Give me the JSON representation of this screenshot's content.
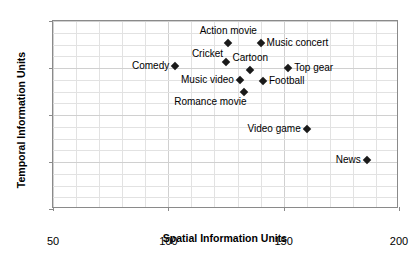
{
  "chart_data": {
    "type": "scatter",
    "title": "",
    "xlabel": "Spatial Information Units",
    "ylabel": "Temporal Information Units",
    "xlim": [
      50,
      200
    ],
    "ylim": [
      0,
      80
    ],
    "xticks": [
      "50",
      "100",
      "150",
      "200"
    ],
    "yticks": [
      "0",
      "20",
      "40",
      "60",
      "80"
    ],
    "xtick_values": [
      50,
      100,
      150,
      200
    ],
    "ytick_values": [
      0,
      20,
      40,
      60,
      80
    ],
    "grid": true,
    "grid_minor_x_step": 10,
    "grid_minor_y_step": 5,
    "legend": "none",
    "marker": "diamond",
    "marker_color": "#1a1a1a",
    "points": [
      {
        "label": "Action movie",
        "x": 126,
        "y": 70.5,
        "label_pos": "above"
      },
      {
        "label": "Music concert",
        "x": 140,
        "y": 70.5,
        "label_pos": "right"
      },
      {
        "label": "Cricket",
        "x": 125,
        "y": 62.5,
        "label_pos": "above-left"
      },
      {
        "label": "Comedy",
        "x": 103,
        "y": 61,
        "label_pos": "left"
      },
      {
        "label": "Top gear",
        "x": 152,
        "y": 60,
        "label_pos": "right"
      },
      {
        "label": "Cartoon",
        "x": 135.5,
        "y": 59,
        "label_pos": "above"
      },
      {
        "label": "Music video",
        "x": 131,
        "y": 55,
        "label_pos": "left"
      },
      {
        "label": "Football",
        "x": 141,
        "y": 54.5,
        "label_pos": "right"
      },
      {
        "label": "Romance movie",
        "x": 133,
        "y": 50,
        "label_pos": "below-left"
      },
      {
        "label": "Video game",
        "x": 160,
        "y": 34,
        "label_pos": "left"
      },
      {
        "label": "News",
        "x": 186,
        "y": 21,
        "label_pos": "left"
      }
    ]
  }
}
